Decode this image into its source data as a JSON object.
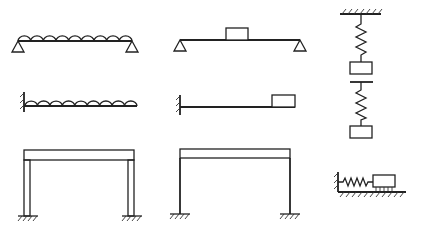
{
  "diagram": {
    "figures": [
      {
        "id": "simply-supported-beam-distributed-mass",
        "description": "Simply supported beam with distributed mass",
        "load_humps": 9
      },
      {
        "id": "simply-supported-beam-lumped-mass",
        "description": "Simply supported beam with lumped mass at midspan"
      },
      {
        "id": "hanging-spring-mass",
        "description": "Spring-mass suspended from fixed ceiling"
      },
      {
        "id": "cantilever-distributed-mass",
        "description": "Cantilever beam with distributed mass",
        "load_humps": 9
      },
      {
        "id": "cantilever-tip-mass",
        "description": "Cantilever beam with tip mass"
      },
      {
        "id": "spring-mass-free",
        "description": "Spring-mass hanging from a support bar"
      },
      {
        "id": "portal-frame-thick-columns",
        "description": "Portal frame with rigid beam and thick columns, fixed bases"
      },
      {
        "id": "portal-frame-thin-columns",
        "description": "Portal frame with rigid beam and slender columns, fixed bases"
      },
      {
        "id": "horizontal-spring-mass-rollers",
        "description": "Horizontal spring-mass on rollers attached to wall"
      }
    ]
  }
}
